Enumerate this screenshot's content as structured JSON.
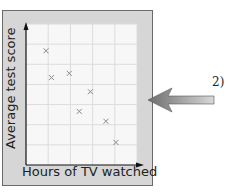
{
  "question_number": "2)",
  "chart_data": {
    "type": "scatter",
    "title": "",
    "xlabel": "Hours of TV watched",
    "ylabel": "Average test score",
    "grid": true,
    "xlim": [
      0,
      10
    ],
    "ylim": [
      0,
      10
    ],
    "points": [
      {
        "x": 1.8,
        "y": 8.1
      },
      {
        "x": 2.3,
        "y": 6.2
      },
      {
        "x": 3.9,
        "y": 6.5
      },
      {
        "x": 5.8,
        "y": 5.2
      },
      {
        "x": 4.8,
        "y": 3.8
      },
      {
        "x": 7.2,
        "y": 3.1
      },
      {
        "x": 8.1,
        "y": 1.6
      }
    ],
    "marker": "x",
    "colors": {
      "frame_bg": "#d6d6d6",
      "plot_bg": "#f7f7f7",
      "grid": "#dcdcdc",
      "marker": "#8a8a8a",
      "axis": "#111111",
      "arrow": "#9a9a9a"
    }
  }
}
